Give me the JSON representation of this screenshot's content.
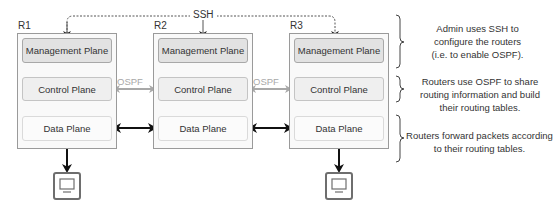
{
  "diagram": {
    "ssh_label": "SSH",
    "ospf_label": "OSPF",
    "routers": [
      {
        "name": "R1",
        "management": "Management Plane",
        "control": "Control Plane",
        "data": "Data Plane",
        "has_host": true
      },
      {
        "name": "R2",
        "management": "Management Plane",
        "control": "Control Plane",
        "data": "Data Plane",
        "has_host": false
      },
      {
        "name": "R3",
        "management": "Management Plane",
        "control": "Control Plane",
        "data": "Data Plane",
        "has_host": true
      }
    ],
    "notes": {
      "management": "Admin uses SSH to configure the routers (i.e. to enable OSPF).",
      "control": "Routers use OSPF to share routing information and build their routing tables.",
      "data": "Routers forward packets according to their routing tables."
    },
    "notes_lines": {
      "management": [
        "Admin uses SSH to",
        "configure the routers",
        "(i.e. to enable OSPF)."
      ],
      "control": [
        "Routers use OSPF to share",
        "routing information and build",
        "their routing tables."
      ],
      "data": [
        "Routers forward packets according",
        "to their routing tables."
      ]
    },
    "icons": [
      "computer-icon",
      "computer-icon"
    ],
    "colors": {
      "management_fill": "#e2e2e2",
      "control_fill": "#efefef",
      "data_fill": "#fbfbfb",
      "ospf_arrow": "#a8a8a8",
      "data_arrow": "#111111"
    }
  }
}
